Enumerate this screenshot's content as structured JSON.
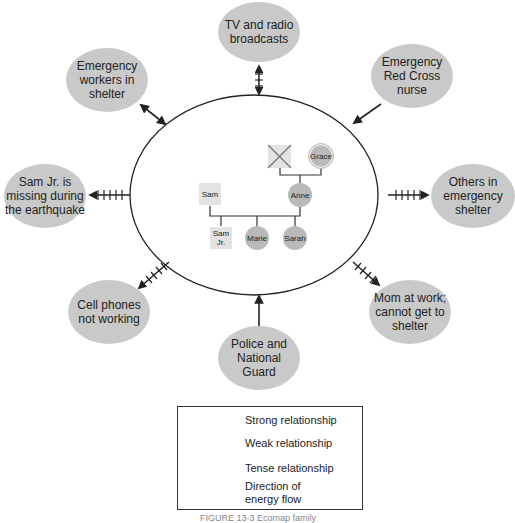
{
  "diagram": {
    "type": "ecomap",
    "center": {
      "label": "family",
      "members": [
        {
          "name": "",
          "sex": "male",
          "deceased": true,
          "generation": 1
        },
        {
          "name": "Grace",
          "sex": "female",
          "generation": 1
        },
        {
          "name": "Sam",
          "sex": "male",
          "generation": 2
        },
        {
          "name": "Anne",
          "sex": "female",
          "generation": 2
        },
        {
          "name": "Sam Jr.",
          "sex": "male",
          "generation": 3
        },
        {
          "name": "Marie",
          "sex": "female",
          "generation": 3
        },
        {
          "name": "Sarah",
          "sex": "female",
          "generation": 3
        }
      ]
    },
    "nodes": [
      {
        "id": "tv",
        "label": "TV and radio broadcasts",
        "relationship": "tense",
        "direction": "both"
      },
      {
        "id": "redcross",
        "label": "Emergency Red Cross nurse",
        "relationship": "strong",
        "direction": "to-family"
      },
      {
        "id": "others",
        "label": "Others in emergency shelter",
        "relationship": "tense",
        "direction": "from-family"
      },
      {
        "id": "mom",
        "label": "Mom at work; cannot get to shelter",
        "relationship": "tense",
        "direction": "from-family"
      },
      {
        "id": "police",
        "label": "Police and National Guard",
        "relationship": "strong",
        "direction": "to-family"
      },
      {
        "id": "cell",
        "label": "Cell phones not working",
        "relationship": "tense",
        "direction": "from-family"
      },
      {
        "id": "samjr",
        "label": "Sam Jr. is missing during the earthquake",
        "relationship": "tense",
        "direction": "from-family"
      },
      {
        "id": "workers",
        "label": "Emergency workers in shelter",
        "relationship": "strong",
        "direction": "both"
      }
    ],
    "labels": {
      "tv": [
        "TV and radio",
        "broadcasts"
      ],
      "redcross": [
        "Emergency",
        "Red Cross",
        "nurse"
      ],
      "others": [
        "Others in",
        "emergency",
        "shelter"
      ],
      "mom": [
        "Mom at work;",
        "cannot get to",
        "shelter"
      ],
      "police": [
        "Police and",
        "National",
        "Guard"
      ],
      "cell": [
        "Cell phones",
        "not working"
      ],
      "samjr": [
        "Sam Jr. is",
        "missing during",
        "the earthquake"
      ],
      "workers": [
        "Emergency",
        "workers in",
        "shelter"
      ]
    },
    "genogram": {
      "grace": "Grace",
      "sam": "Sam",
      "anne": "Anne",
      "samjr_line1": "Sam",
      "samjr_line2": "Jr.",
      "marie": "Marie",
      "sarah": "Sarah"
    }
  },
  "legend": {
    "items": [
      {
        "key": "strong",
        "label": "Strong relationship"
      },
      {
        "key": "weak",
        "label": "Weak relationship"
      },
      {
        "key": "tense",
        "label": "Tense relationship"
      },
      {
        "key": "flow",
        "label_line1": "Direction of",
        "label_line2": "energy flow"
      }
    ]
  },
  "caption": "FIGURE 13-3  Ecomap family"
}
